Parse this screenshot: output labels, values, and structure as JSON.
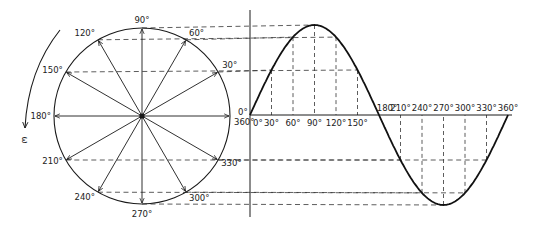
{
  "diagram": {
    "title": "",
    "type": "phasor-to-sine-wave projection",
    "rotation_symbol": "ω",
    "rotation_direction": "counterclockwise",
    "phasor_angles_deg": [
      0,
      30,
      60,
      90,
      120,
      150,
      180,
      210,
      240,
      270,
      300,
      330
    ],
    "phasor_labels": [
      {
        "angle": 0,
        "text": "0°"
      },
      {
        "angle": 0,
        "text": "360°",
        "secondary": true
      },
      {
        "angle": 30,
        "text": "30°"
      },
      {
        "angle": 60,
        "text": "60°"
      },
      {
        "angle": 90,
        "text": "90°"
      },
      {
        "angle": 120,
        "text": "120°"
      },
      {
        "angle": 150,
        "text": "150°"
      },
      {
        "angle": 180,
        "text": "180°"
      },
      {
        "angle": 210,
        "text": "210°"
      },
      {
        "angle": 240,
        "text": "240°"
      },
      {
        "angle": 270,
        "text": "270°"
      },
      {
        "angle": 300,
        "text": "300°"
      },
      {
        "angle": 330,
        "text": "330°"
      }
    ],
    "wave": {
      "function": "sine",
      "x_range_deg": [
        0,
        360
      ],
      "tick_labels_above_axis": [
        "0°",
        "30°",
        "60°",
        "90°",
        "120°",
        "150°"
      ],
      "tick_labels_positive_half": [
        0,
        30,
        60,
        90,
        120,
        150
      ],
      "tick_labels_negative_half": [
        180,
        210,
        240,
        270,
        300,
        330,
        360
      ],
      "tick_text": {
        "0": "0°",
        "30": "30°",
        "60": "60°",
        "90": "90°",
        "120": "120°",
        "150": "150°",
        "180": "180°",
        "210": "210°",
        "240": "240°",
        "270": "270°",
        "300": "300°",
        "330": "330°",
        "360": "360°"
      },
      "projection_angles_deg": [
        30,
        60,
        90,
        120,
        150,
        210,
        240,
        270,
        300,
        330
      ]
    }
  }
}
